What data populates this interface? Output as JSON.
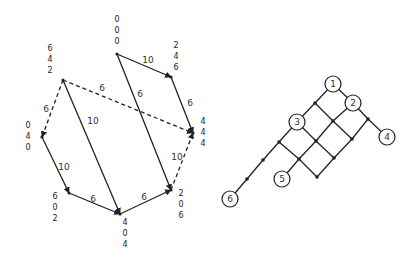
{
  "left_diagram": {
    "nodes": [
      {
        "id": "a",
        "x": 117,
        "y": 54,
        "label": [
          "0",
          "0",
          "0"
        ],
        "lx": 117,
        "ly": 22
      },
      {
        "id": "b",
        "x": 171,
        "y": 77,
        "label": [
          "2",
          "4",
          "6"
        ],
        "lx": 176,
        "ly": 48
      },
      {
        "id": "c",
        "x": 63,
        "y": 80,
        "label": [
          "6",
          "4",
          "2"
        ],
        "lx": 50,
        "ly": 51
      },
      {
        "id": "d",
        "x": 193,
        "y": 133,
        "label": [
          "4",
          "4",
          "4"
        ],
        "lx": 203,
        "ly": 124
      },
      {
        "id": "e",
        "x": 42,
        "y": 137,
        "label": [
          "0",
          "4",
          "0"
        ],
        "lx": 28,
        "ly": 128
      },
      {
        "id": "f",
        "x": 69,
        "y": 193,
        "label": [
          "6",
          "0",
          "2"
        ],
        "lx": 55,
        "ly": 199
      },
      {
        "id": "g",
        "x": 120,
        "y": 214,
        "label": [
          "4",
          "0",
          "4"
        ],
        "lx": 125,
        "ly": 225
      },
      {
        "id": "h",
        "x": 171,
        "y": 190,
        "label": [
          "2",
          "0",
          "6"
        ],
        "lx": 181,
        "ly": 196
      }
    ],
    "edges": [
      {
        "from": "a",
        "to": "b",
        "w": "10",
        "dashed": false,
        "wx": 148,
        "wy": 63
      },
      {
        "from": "b",
        "to": "d",
        "w": "6",
        "dashed": false,
        "wx": 190,
        "wy": 106
      },
      {
        "from": "a",
        "to": "h",
        "w": "6",
        "dashed": false,
        "wx": 140,
        "wy": 97
      },
      {
        "from": "c",
        "to": "d",
        "w": "6",
        "dashed": true,
        "wx": 102,
        "wy": 91
      },
      {
        "from": "c",
        "to": "e",
        "w": "6",
        "dashed": true,
        "wx": 46,
        "wy": 112
      },
      {
        "from": "c",
        "to": "g",
        "w": "10",
        "dashed": false,
        "wx": 93,
        "wy": 124
      },
      {
        "from": "e",
        "to": "f",
        "w": "10",
        "dashed": false,
        "wx": 64,
        "wy": 170
      },
      {
        "from": "f",
        "to": "g",
        "w": "6",
        "dashed": false,
        "wx": 93,
        "wy": 202
      },
      {
        "from": "g",
        "to": "h",
        "w": "6",
        "dashed": false,
        "wx": 144,
        "wy": 200
      },
      {
        "from": "h",
        "to": "d",
        "w": "10",
        "dashed": true,
        "wx": 177,
        "wy": 160
      }
    ]
  },
  "right_diagram": {
    "circles": [
      {
        "id": "1",
        "x": 333,
        "y": 84
      },
      {
        "id": "2",
        "x": 353,
        "y": 103
      },
      {
        "id": "3",
        "x": 297,
        "y": 122
      },
      {
        "id": "4",
        "x": 387,
        "y": 137
      },
      {
        "id": "5",
        "x": 282,
        "y": 179
      },
      {
        "id": "6",
        "x": 230,
        "y": 199
      }
    ],
    "dots": [
      {
        "id": "j1",
        "x": 315,
        "y": 103
      },
      {
        "id": "j2",
        "x": 333,
        "y": 121
      },
      {
        "id": "j3",
        "x": 368,
        "y": 119
      },
      {
        "id": "j4",
        "x": 279,
        "y": 142
      },
      {
        "id": "j5",
        "x": 316,
        "y": 141
      },
      {
        "id": "j6",
        "x": 352,
        "y": 139
      },
      {
        "id": "j7",
        "x": 299,
        "y": 159
      },
      {
        "id": "j8",
        "x": 334,
        "y": 158
      },
      {
        "id": "j9",
        "x": 317,
        "y": 177
      },
      {
        "id": "j10",
        "x": 263,
        "y": 160
      },
      {
        "id": "j11",
        "x": 247,
        "y": 179
      }
    ],
    "lines": [
      [
        "1",
        "j1"
      ],
      [
        "1",
        "2"
      ],
      [
        "j1",
        "3"
      ],
      [
        "j1",
        "j2"
      ],
      [
        "2",
        "j2"
      ],
      [
        "2",
        "j3"
      ],
      [
        "j3",
        "4"
      ],
      [
        "3",
        "j4"
      ],
      [
        "3",
        "j5"
      ],
      [
        "j2",
        "j5"
      ],
      [
        "j2",
        "j6"
      ],
      [
        "j3",
        "j6"
      ],
      [
        "j4",
        "j7"
      ],
      [
        "j5",
        "j7"
      ],
      [
        "j5",
        "j8"
      ],
      [
        "j6",
        "j8"
      ],
      [
        "j7",
        "j9"
      ],
      [
        "j8",
        "j9"
      ],
      [
        "j7",
        "5"
      ],
      [
        "j4",
        "j10"
      ],
      [
        "j10",
        "j11"
      ],
      [
        "j11",
        "6"
      ]
    ]
  }
}
